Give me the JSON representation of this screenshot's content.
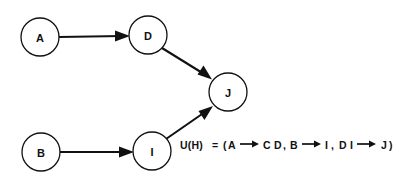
{
  "figure": {
    "background_color": "#ffffff",
    "ink_color": "#111111"
  },
  "graph": {
    "nodes": [
      {
        "id": "A",
        "label": "A",
        "cx": 40,
        "cy": 37,
        "r": 19
      },
      {
        "id": "D",
        "label": "D",
        "cx": 148,
        "cy": 35,
        "r": 19
      },
      {
        "id": "J",
        "label": "J",
        "cx": 228,
        "cy": 92,
        "r": 19
      },
      {
        "id": "B",
        "label": "B",
        "cx": 41,
        "cy": 152,
        "r": 19
      },
      {
        "id": "I",
        "label": "I",
        "cx": 152,
        "cy": 151,
        "r": 19
      }
    ],
    "edges": [
      {
        "from": "A",
        "to": "D",
        "label": ""
      },
      {
        "from": "D",
        "to": "J",
        "label": ""
      },
      {
        "from": "B",
        "to": "I",
        "label": ""
      },
      {
        "from": "I",
        "to": "J",
        "label": ""
      }
    ]
  },
  "annotation": {
    "lhs": "U(H)",
    "equals": "=",
    "open_paren": "(",
    "close_paren": ")",
    "rules": [
      {
        "antecedent": "A",
        "consequent": "C D",
        "separator": ","
      },
      {
        "antecedent": "B",
        "consequent": "I",
        "separator": ","
      },
      {
        "antecedent": "D I",
        "consequent": "J",
        "separator": ""
      }
    ],
    "arrow_icon": "right-arrow-icon",
    "full_text": "U(H) = (A → C D, B → I, D I → J)"
  }
}
